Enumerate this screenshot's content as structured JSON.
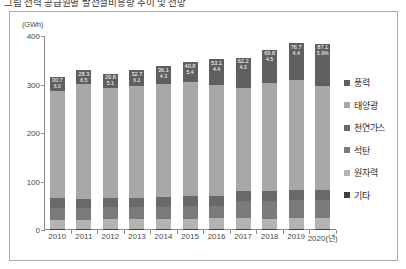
{
  "caption": {
    "text": "그림  전력 공급원별 발전설비용량 추이 및 전망"
  },
  "chart_data": {
    "type": "bar",
    "stacked": true,
    "title": "",
    "unit_label": "(GWh)",
    "xlabel": "",
    "ylabel": "",
    "ylim": [
      0,
      400
    ],
    "yticks": [
      0,
      100,
      200,
      300,
      400
    ],
    "grid": false,
    "legend_position": "right",
    "categories": [
      "2010",
      "2011",
      "2012",
      "2013",
      "2014",
      "2015",
      "2016",
      "2017",
      "2018",
      "2019",
      "2020(년)"
    ],
    "series": [
      {
        "name": "기타",
        "color": "#3f3f3f",
        "values": [
          3.0,
          1.5,
          1.5,
          1.5,
          1.5,
          1.5,
          1.5,
          1.5,
          1.5,
          1.5,
          1.5
        ]
      },
      {
        "name": "원자력",
        "color": "#b4b4b4",
        "values": [
          17.7,
          18.7,
          20.7,
          20.7,
          20.7,
          21.7,
          22.5,
          22.5,
          21.9,
          23.3,
          23.3
        ]
      },
      {
        "name": "석탄",
        "color": "#7a7a7a",
        "values": [
          24.5,
          24.5,
          24.5,
          24.5,
          26.0,
          26.5,
          26.0,
          36.7,
          36.7,
          36.9,
          36.9
        ]
      },
      {
        "name": "천연가스",
        "color": "#696969",
        "values": [
          20.0,
          20.0,
          20.0,
          20.0,
          20.0,
          20.0,
          20.0,
          20.0,
          20.0,
          20.0,
          20.0
        ]
      },
      {
        "name": "태양광",
        "color": "#a8a8a8",
        "values": [
          220.5,
          236.7,
          225.9,
          230.1,
          233.6,
          235.7,
          229.3,
          212.6,
          222.3,
          227.1,
          215.6
        ]
      },
      {
        "name": "풍력",
        "color": "#5f5f5f",
        "values": [
          30.7,
          28.3,
          29.8,
          32.7,
          36.1,
          40.8,
          53.1,
          62.2,
          69.8,
          76.7,
          87.1
        ]
      }
    ],
    "totals": [
      316.4,
      329.7,
      322.4,
      329.5,
      337.9,
      346.2,
      352.4,
      355.5,
      372.2,
      385.5,
      384.4
    ],
    "bar_top_labels": [
      "30.7",
      "28.3",
      "29.8",
      "32.7",
      "36.1",
      "40.8",
      "53.1",
      "62.2",
      "69.8",
      "76.7",
      "87.1"
    ],
    "bar_sub_labels": [
      "6.0",
      "6.5",
      "5.1",
      "6.1",
      "4.3",
      "5.4",
      "4.4",
      "4.3",
      "4.5",
      "4.4",
      "5.9%"
    ]
  },
  "legend": {
    "items": [
      {
        "label": "풍력",
        "color": "#5f5f5f"
      },
      {
        "label": "태양광",
        "color": "#a8a8a8"
      },
      {
        "label": "천연가스",
        "color": "#696969"
      },
      {
        "label": "석탄",
        "color": "#7a7a7a"
      },
      {
        "label": "원자력",
        "color": "#b4b4b4"
      },
      {
        "label": "기타",
        "color": "#3f3f3f"
      }
    ]
  }
}
